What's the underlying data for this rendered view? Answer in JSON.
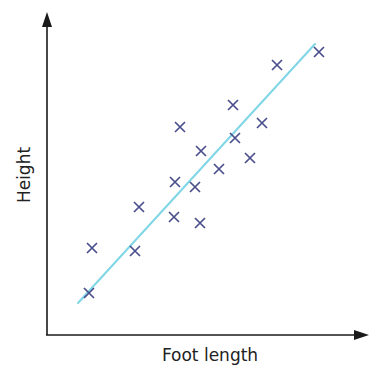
{
  "chart_data": {
    "type": "scatter",
    "title": "",
    "xlabel": "Foot length",
    "ylabel": "Height",
    "grid": false,
    "legend": null,
    "ticks": false,
    "axis_arrows": true,
    "note": "Coordinates are in pixel space (no numeric scale shown); y increases downward.",
    "points": [
      {
        "x": 89,
        "y": 293
      },
      {
        "x": 92,
        "y": 248
      },
      {
        "x": 135,
        "y": 251
      },
      {
        "x": 139,
        "y": 207
      },
      {
        "x": 174,
        "y": 217
      },
      {
        "x": 175,
        "y": 182
      },
      {
        "x": 180,
        "y": 127
      },
      {
        "x": 195,
        "y": 187
      },
      {
        "x": 200,
        "y": 223
      },
      {
        "x": 201,
        "y": 151
      },
      {
        "x": 219,
        "y": 169
      },
      {
        "x": 233,
        "y": 105
      },
      {
        "x": 235,
        "y": 138
      },
      {
        "x": 250,
        "y": 158
      },
      {
        "x": 262,
        "y": 123
      },
      {
        "x": 277,
        "y": 65
      },
      {
        "x": 319,
        "y": 52
      }
    ],
    "trend_line": {
      "x1": 78,
      "y1": 303,
      "x2": 315,
      "y2": 44,
      "label": "line of best fit"
    }
  },
  "colors": {
    "axis": "#1a1a1a",
    "marker": "#4a4f8c",
    "trend_line": "#7fd6e6"
  },
  "labels": {
    "x_axis": "Foot length",
    "y_axis": "Height"
  }
}
